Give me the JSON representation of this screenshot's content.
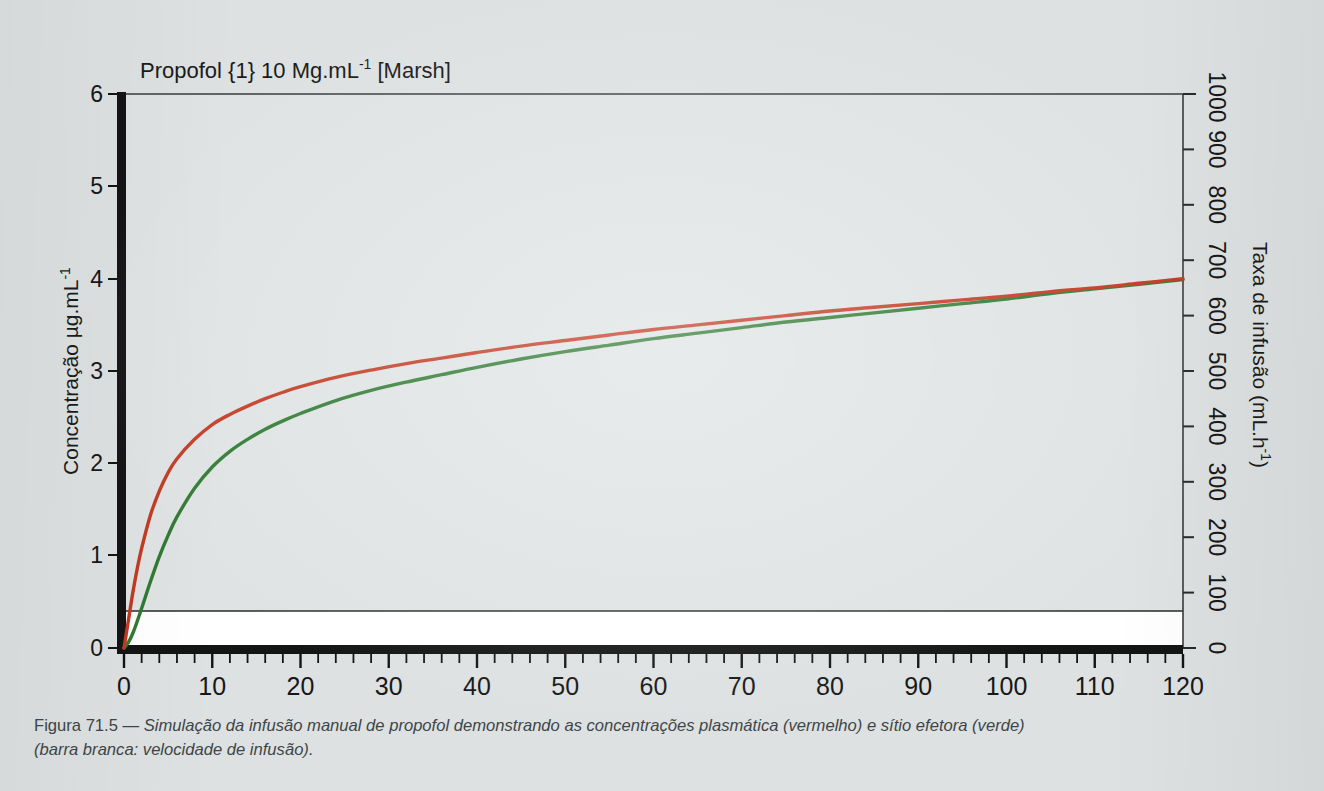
{
  "figure": {
    "caption_label": "Figura 71.5",
    "caption_dash": " — ",
    "caption_line1": "Simulação da infusão manual de propofol demonstrando as concentrações plasmática (vermelho) e sítio efetora (verde)",
    "caption_line2": "(barra branca: velocidade de infusão)."
  },
  "colors": {
    "page_background": "#dde1e1",
    "plot_background": "#dfe3e3",
    "plasma_red": "#c23a22",
    "effect_green": "#2f7a32",
    "axis_black": "#141414",
    "infusion_bar_white": "#ffffff",
    "caption_text": "#3e4548"
  },
  "chart_data": {
    "type": "line",
    "title": "Propofol {1} 10 Mg.mL-1 [Marsh]",
    "title_parts": {
      "main": "Propofol {1} 10 Mg.mL",
      "sup": "-1",
      "tail": " [Marsh]"
    },
    "xlabel": "Tempo (min)",
    "ylabel": "Concentração µg.mL-1",
    "ylabel_parts": {
      "main": "Concentração µg.mL",
      "sup": "-1"
    },
    "y2label": "Taxa de infusão (mL.h-1)",
    "y2label_parts": {
      "main": "Taxa de infusão (mL.h",
      "sup": "-1",
      "tail": ")"
    },
    "xlim": [
      0,
      120
    ],
    "ylim": [
      0,
      6
    ],
    "y2lim": [
      0,
      1000
    ],
    "xticks": [
      0,
      10,
      20,
      30,
      40,
      50,
      60,
      70,
      80,
      90,
      100,
      110,
      120
    ],
    "xticks_minor_step": 2,
    "yticks": [
      0,
      1,
      2,
      3,
      4,
      5,
      6
    ],
    "y2ticks": [
      0,
      100,
      200,
      300,
      400,
      500,
      600,
      700,
      800,
      900,
      1000
    ],
    "grid": false,
    "legend": "none",
    "annotations": [
      "barra branca: velocidade de infusão"
    ],
    "series": [
      {
        "name": "Concentração plasmática (vermelho)",
        "color": "#c23a22",
        "x": [
          0,
          0.5,
          1,
          1.5,
          2,
          3,
          4,
          5,
          6,
          8,
          10,
          12,
          14,
          16,
          18,
          20,
          24,
          28,
          32,
          36,
          40,
          45,
          50,
          55,
          60,
          65,
          70,
          75,
          80,
          85,
          90,
          95,
          100,
          105,
          110,
          115,
          120
        ],
        "y": [
          0.0,
          0.3,
          0.6,
          0.86,
          1.08,
          1.44,
          1.7,
          1.9,
          2.05,
          2.26,
          2.42,
          2.53,
          2.62,
          2.7,
          2.77,
          2.83,
          2.93,
          3.01,
          3.08,
          3.14,
          3.2,
          3.27,
          3.33,
          3.39,
          3.45,
          3.5,
          3.55,
          3.6,
          3.65,
          3.69,
          3.73,
          3.77,
          3.81,
          3.86,
          3.9,
          3.95,
          4.0
        ]
      },
      {
        "name": "Concentração sítio efetor (verde)",
        "color": "#2f7a32",
        "x": [
          0,
          0.5,
          1,
          1.5,
          2,
          3,
          4,
          5,
          6,
          8,
          10,
          12,
          14,
          16,
          18,
          20,
          24,
          28,
          32,
          36,
          40,
          45,
          50,
          55,
          60,
          65,
          70,
          75,
          80,
          85,
          90,
          95,
          100,
          105,
          110,
          115,
          120
        ],
        "y": [
          0.0,
          0.06,
          0.16,
          0.29,
          0.43,
          0.72,
          0.99,
          1.22,
          1.42,
          1.73,
          1.96,
          2.13,
          2.26,
          2.37,
          2.46,
          2.54,
          2.68,
          2.79,
          2.88,
          2.96,
          3.04,
          3.13,
          3.21,
          3.28,
          3.35,
          3.41,
          3.47,
          3.53,
          3.58,
          3.63,
          3.68,
          3.73,
          3.78,
          3.84,
          3.89,
          3.94,
          3.99
        ]
      }
    ],
    "infusion_bar": {
      "name": "Velocidade de infusão (barra branca)",
      "color": "#ffffff",
      "x_start": 0,
      "x_end": 120,
      "rate_ml_h": 60,
      "concentration_equivalent": 0.4
    }
  }
}
